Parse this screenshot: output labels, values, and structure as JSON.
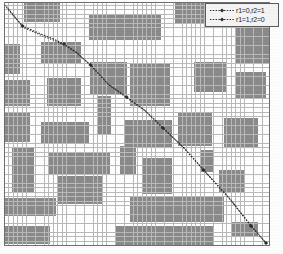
{
  "figure": {
    "type": "grid-occupancy-map-with-paths",
    "background_color": "#ffffff",
    "plot": {
      "x": 4,
      "y": 2,
      "width": 266,
      "height": 244
    },
    "grid": {
      "cell_size": 4.45,
      "columns": 60,
      "rows": 55,
      "line_color": "#b9b9b9",
      "free_cell_color": "#ffffff",
      "occupied_cell_color": "#8a8a8a",
      "border_color": "#6e6e6e"
    }
  },
  "legend": {
    "position": "top-right",
    "box": {
      "x": 205,
      "y": 3,
      "width": 74,
      "height": 24
    },
    "background_color": "#f4f4f4",
    "border_color": "#5a5a5a",
    "entries": [
      {
        "label": "r1=0,r2=1",
        "color": "#2a2a2a",
        "line_style": "dotted",
        "marker": "diamond"
      },
      {
        "label": "r1=1,r2=0",
        "color": "#2a2a2a",
        "line_style": "dotted",
        "marker": "diamond"
      }
    ]
  },
  "chart_data": {
    "type": "line",
    "title": "",
    "xlabel": "",
    "ylabel": "",
    "xlim": [
      0,
      60
    ],
    "ylim": [
      0,
      55
    ],
    "grid": true,
    "legend_position": "upper right",
    "series": [
      {
        "name": "r1=0,r2=1",
        "color": "#2a2a2a",
        "line_style": "dotted",
        "marker": "diamond",
        "x": [
          0.5,
          18.5,
          38.0,
          49.5,
          60.0,
          72.0,
          86.5,
          104.0,
          122.5,
          140.5,
          159.0,
          180.0,
          199.5,
          225.0,
          247.0,
          262.0
        ],
        "y": [
          3.0,
          24.0,
          32.5,
          37.0,
          42.0,
          50.0,
          63.0,
          82.0,
          95.0,
          108.0,
          126.0,
          146.0,
          168.0,
          196.0,
          224.0,
          241.0
        ]
      },
      {
        "name": "r1=1,r2=0",
        "color": "#2a2a2a",
        "line_style": "dotted",
        "marker": "diamond",
        "x": [
          2.5,
          19.5,
          38.5,
          50.5,
          61.0,
          73.5,
          88.0,
          105.5,
          124.0,
          142.0,
          160.5,
          181.5,
          201.0,
          226.5,
          248.5,
          263.5
        ],
        "y": [
          4.5,
          25.5,
          34.0,
          38.5,
          43.5,
          51.5,
          64.5,
          83.5,
          96.5,
          109.5,
          127.5,
          147.5,
          169.5,
          197.5,
          225.5,
          242.5
        ]
      }
    ],
    "waypoint_markers": [
      {
        "x": 18.5,
        "y": 24.0
      },
      {
        "x": 60.0,
        "y": 42.0
      },
      {
        "x": 86.5,
        "y": 63.0
      },
      {
        "x": 122.5,
        "y": 95.0
      },
      {
        "x": 159.0,
        "y": 126.0
      },
      {
        "x": 199.5,
        "y": 168.0
      },
      {
        "x": 247.0,
        "y": 224.0
      },
      {
        "x": 262.0,
        "y": 241.0
      }
    ],
    "obstacles": [
      {
        "x": 24,
        "y": 2,
        "w": 36,
        "h": 20
      },
      {
        "x": 89,
        "y": 14,
        "w": 72,
        "h": 26
      },
      {
        "x": 175,
        "y": 2,
        "w": 42,
        "h": 22
      },
      {
        "x": 236,
        "y": 28,
        "w": 34,
        "h": 36
      },
      {
        "x": 4,
        "y": 44,
        "w": 16,
        "h": 30
      },
      {
        "x": 41,
        "y": 42,
        "w": 40,
        "h": 22
      },
      {
        "x": 90,
        "y": 62,
        "w": 37,
        "h": 32
      },
      {
        "x": 130,
        "y": 64,
        "w": 40,
        "h": 42
      },
      {
        "x": 194,
        "y": 62,
        "w": 32,
        "h": 30
      },
      {
        "x": 236,
        "y": 72,
        "w": 30,
        "h": 26
      },
      {
        "x": 4,
        "y": 80,
        "w": 26,
        "h": 26
      },
      {
        "x": 47,
        "y": 78,
        "w": 34,
        "h": 28
      },
      {
        "x": 4,
        "y": 112,
        "w": 26,
        "h": 30
      },
      {
        "x": 97,
        "y": 96,
        "w": 14,
        "h": 38
      },
      {
        "x": 41,
        "y": 122,
        "w": 48,
        "h": 22
      },
      {
        "x": 124,
        "y": 120,
        "w": 48,
        "h": 28
      },
      {
        "x": 178,
        "y": 112,
        "w": 34,
        "h": 34
      },
      {
        "x": 224,
        "y": 118,
        "w": 34,
        "h": 30
      },
      {
        "x": 12,
        "y": 148,
        "w": 22,
        "h": 44
      },
      {
        "x": 48,
        "y": 152,
        "w": 62,
        "h": 22
      },
      {
        "x": 120,
        "y": 146,
        "w": 16,
        "h": 28
      },
      {
        "x": 200,
        "y": 150,
        "w": 14,
        "h": 22
      },
      {
        "x": 58,
        "y": 176,
        "w": 44,
        "h": 28
      },
      {
        "x": 142,
        "y": 158,
        "w": 30,
        "h": 36
      },
      {
        "x": 219,
        "y": 170,
        "w": 26,
        "h": 22
      },
      {
        "x": 4,
        "y": 198,
        "w": 52,
        "h": 18
      },
      {
        "x": 130,
        "y": 196,
        "w": 94,
        "h": 26
      },
      {
        "x": 4,
        "y": 226,
        "w": 46,
        "h": 18
      },
      {
        "x": 116,
        "y": 226,
        "w": 98,
        "h": 20
      },
      {
        "x": 232,
        "y": 222,
        "w": 26,
        "h": 14
      }
    ]
  }
}
